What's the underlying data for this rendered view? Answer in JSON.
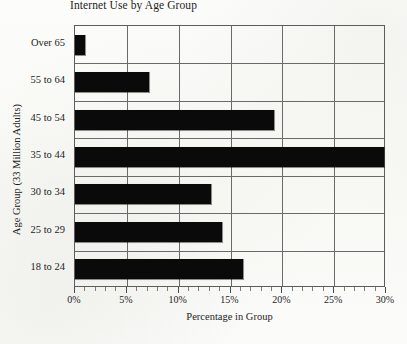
{
  "chart_data": {
    "type": "bar",
    "orientation": "horizontal",
    "title": "Internet Use by Age Group",
    "xlabel": "Percentage in Group",
    "ylabel": "Age Group (33 Million Adults)",
    "categories": [
      "Over 65",
      "55 to 64",
      "45 to 54",
      "35 to 44",
      "30 to 34",
      "25 to 29",
      "18 to 24"
    ],
    "values": [
      1.0,
      7.1,
      19.2,
      30.0,
      13.1,
      14.2,
      16.2
    ],
    "xlim": [
      0,
      30
    ],
    "xticks": [
      0,
      5,
      10,
      15,
      20,
      25,
      30
    ],
    "xtick_labels": [
      "0%",
      "5%",
      "10%",
      "15%",
      "20%",
      "25%",
      "30%"
    ],
    "minor_tick_step": 1,
    "grid": "vertical-and-horizontal",
    "legend": "none",
    "bar_color": "#0a0a0a",
    "frame_color": "#5d5d5d",
    "background": "#fdfdfb"
  }
}
